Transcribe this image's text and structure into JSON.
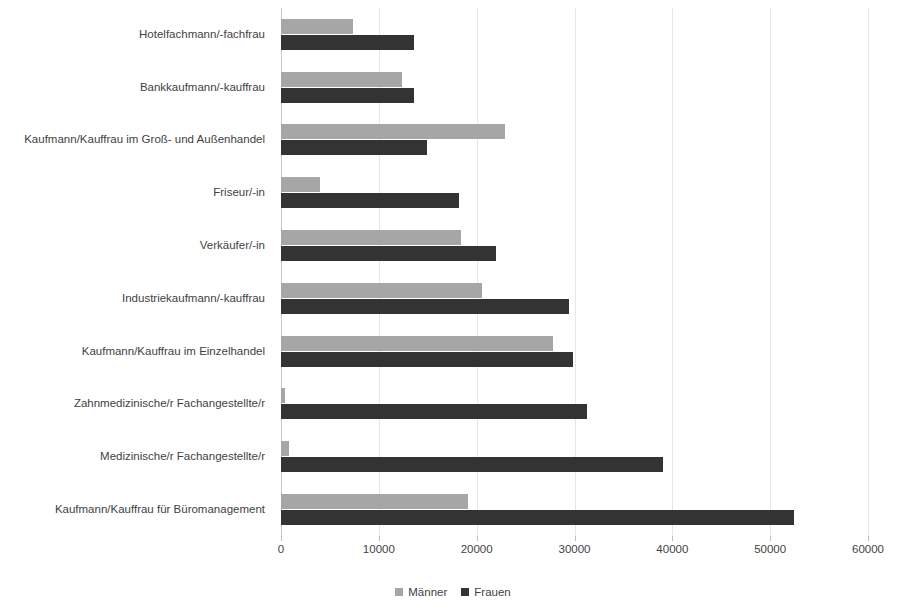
{
  "chart_data": {
    "type": "bar",
    "orientation": "horizontal",
    "title": "",
    "subtitle": "",
    "xlabel": "",
    "ylabel": "",
    "xlim": [
      0,
      60000
    ],
    "xticks": [
      0,
      10000,
      20000,
      30000,
      40000,
      50000,
      60000
    ],
    "xtick_labels": [
      "0",
      "10000",
      "20000",
      "30000",
      "40000",
      "50000",
      "60000"
    ],
    "grid": true,
    "grid_axis": "x",
    "legend_position": "bottom-center",
    "categories": [
      "Hotelfachmann/-fachfrau",
      "Bankkaufmann/-kauffrau",
      "Kaufmann/Kauffrau im Groß- und Außenhandel",
      "Friseur/-in",
      "Verkäufer/-in",
      "Industriekaufmann/-kauffrau",
      "Kaufmann/Kauffrau im Einzelhandel",
      "Zahnmedizinische/r Fachangestellte/r",
      "Medizinische/r Fachangestellte/r",
      "Kaufmann/Kauffrau für Büromanagement"
    ],
    "series": [
      {
        "name": "Männer",
        "color": "#a6a6a6",
        "values": [
          7400,
          12400,
          22900,
          4000,
          18400,
          20500,
          27800,
          400,
          800,
          19100
        ]
      },
      {
        "name": "Frauen",
        "color": "#333333",
        "values": [
          13600,
          13600,
          14900,
          18200,
          22000,
          29400,
          29800,
          31300,
          39000,
          52400
        ]
      }
    ]
  },
  "legend": {
    "items": [
      {
        "label": "Männer",
        "key": "maenner"
      },
      {
        "label": "Frauen",
        "key": "frauen"
      }
    ]
  },
  "colors": {
    "maenner": "#a6a6a6",
    "frauen": "#333333",
    "gridline": "#e6e6e6",
    "text": "#3f3f3f",
    "background": "#ffffff"
  }
}
